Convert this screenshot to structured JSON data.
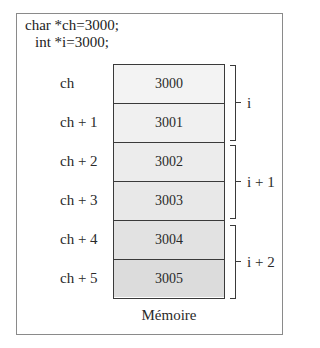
{
  "code": {
    "line1": "char *ch=3000;",
    "line2": "int *i=3000;"
  },
  "memory": {
    "caption": "Mémoire",
    "cells": [
      {
        "address": "3000",
        "pointer_label": "ch",
        "fill": "#f3f3f3"
      },
      {
        "address": "3001",
        "pointer_label": "ch + 1",
        "fill": "#f0f0f0"
      },
      {
        "address": "3002",
        "pointer_label": "ch + 2",
        "fill": "#ececec"
      },
      {
        "address": "3003",
        "pointer_label": "ch + 3",
        "fill": "#e8e8e8"
      },
      {
        "address": "3004",
        "pointer_label": "ch + 4",
        "fill": "#e2e2e2"
      },
      {
        "address": "3005",
        "pointer_label": "ch + 5",
        "fill": "#dcdcdc"
      }
    ]
  },
  "int_groups": [
    {
      "label": "i",
      "spans_cells": [
        0,
        1
      ]
    },
    {
      "label": "i + 1",
      "spans_cells": [
        2,
        3
      ]
    },
    {
      "label": "i + 2",
      "spans_cells": [
        4,
        5
      ]
    }
  ],
  "colors": {
    "frame_border": "#8a8a8a",
    "line": "#3a3a3a",
    "text": "#2a2a2a"
  }
}
